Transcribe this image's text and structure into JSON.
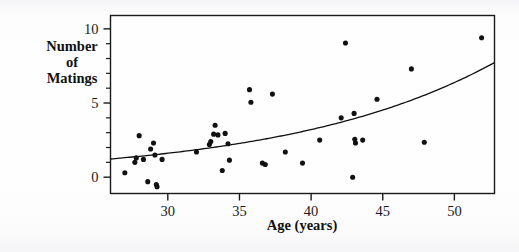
{
  "chart_data": {
    "type": "scatter",
    "title": "",
    "xlabel": "Age (years)",
    "ylabel": "Number of Matings",
    "ylabel_lines": [
      "Number",
      "of",
      "Matings"
    ],
    "xlim": [
      26.0,
      52.8
    ],
    "ylim": [
      -1.1,
      10.9
    ],
    "xticks": [
      30,
      35,
      40,
      45,
      50
    ],
    "xticklabels": [
      "30",
      "35",
      "40",
      "45",
      "50"
    ],
    "xminorticks": [],
    "yticks": [
      0,
      5,
      10
    ],
    "yticklabels": [
      "0",
      "5",
      "10"
    ],
    "yminorticks": [
      1,
      2,
      3,
      4,
      6,
      7,
      8,
      9
    ],
    "grid": false,
    "legend": false,
    "legend_position": "none",
    "marker": "filled-circle",
    "marker_color": "#111111",
    "marker_size_px": 4.4,
    "frame": true,
    "frame_color": "#1a1a1a",
    "points": [
      {
        "x": 27.0,
        "y": 0.3
      },
      {
        "x": 27.7,
        "y": 1.0
      },
      {
        "x": 27.8,
        "y": 1.3
      },
      {
        "x": 28.0,
        "y": 2.8
      },
      {
        "x": 28.3,
        "y": 1.2
      },
      {
        "x": 28.6,
        "y": -0.3
      },
      {
        "x": 28.8,
        "y": 1.9
      },
      {
        "x": 29.0,
        "y": 2.3
      },
      {
        "x": 29.1,
        "y": 1.5
      },
      {
        "x": 29.2,
        "y": -0.5
      },
      {
        "x": 29.25,
        "y": -0.65
      },
      {
        "x": 29.6,
        "y": 1.2
      },
      {
        "x": 32.0,
        "y": 1.7
      },
      {
        "x": 32.9,
        "y": 2.2
      },
      {
        "x": 33.0,
        "y": 2.4
      },
      {
        "x": 33.2,
        "y": 2.9
      },
      {
        "x": 33.3,
        "y": 3.5
      },
      {
        "x": 33.5,
        "y": 2.85
      },
      {
        "x": 33.8,
        "y": 0.45
      },
      {
        "x": 34.0,
        "y": 2.95
      },
      {
        "x": 34.2,
        "y": 2.25
      },
      {
        "x": 34.3,
        "y": 1.15
      },
      {
        "x": 35.7,
        "y": 5.9
      },
      {
        "x": 35.8,
        "y": 5.05
      },
      {
        "x": 36.6,
        "y": 0.95
      },
      {
        "x": 36.8,
        "y": 0.85
      },
      {
        "x": 37.3,
        "y": 5.6
      },
      {
        "x": 38.2,
        "y": 1.7
      },
      {
        "x": 39.4,
        "y": 0.95
      },
      {
        "x": 40.6,
        "y": 2.5
      },
      {
        "x": 42.1,
        "y": 4.0
      },
      {
        "x": 42.4,
        "y": 9.05
      },
      {
        "x": 42.9,
        "y": 0.0
      },
      {
        "x": 43.0,
        "y": 4.3
      },
      {
        "x": 43.05,
        "y": 2.55
      },
      {
        "x": 43.1,
        "y": 2.3
      },
      {
        "x": 43.6,
        "y": 2.5
      },
      {
        "x": 44.6,
        "y": 5.25
      },
      {
        "x": 47.0,
        "y": 7.3
      },
      {
        "x": 47.9,
        "y": 2.35
      },
      {
        "x": 51.9,
        "y": 9.4
      }
    ],
    "fit_curve": {
      "name": "fitted Poisson regression curve",
      "color": "#111111",
      "width_px": 1.3,
      "formula": "exp(a + b*x)",
      "a": -1.582,
      "b": 0.0687,
      "x_start": 26.0,
      "x_end": 52.8,
      "y_at_x_start": 1.25,
      "y_at_x_end": 7.25
    }
  },
  "axes": {
    "x_axis_label": "Age (years)",
    "y_axis_label_lines": [
      "Number",
      "of",
      "Matings"
    ]
  }
}
